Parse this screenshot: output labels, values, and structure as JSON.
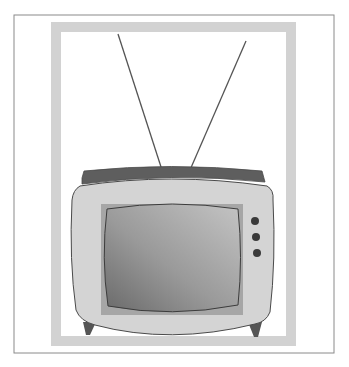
{
  "illustration": {
    "subject": "vintage television with rabbit-ear antenna",
    "colors": {
      "background": "#ffffff",
      "outer_border": "#8a8a8a",
      "matte_frame": "#d2d2d2",
      "antenna": "#555555",
      "tv_top": "#5e5e5e",
      "tv_body": "#d4d4d4",
      "tv_outline": "#4a4a4a",
      "bezel": "#a6a6a6",
      "screen_light": "#bdbdbd",
      "screen_dark": "#6e6e6e",
      "knob": "#3a3a3a",
      "leg": "#555555"
    },
    "knobs": [
      {
        "cx": 255,
        "cy": 221
      },
      {
        "cx": 256,
        "cy": 237
      },
      {
        "cx": 257,
        "cy": 253
      }
    ]
  }
}
